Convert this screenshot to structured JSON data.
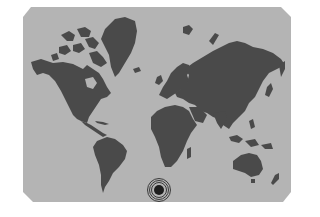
{
  "map": {
    "projection": "world-map",
    "ocean_color": "#b4b4b4",
    "land_color": "#4a4a4a",
    "background_color": "#ffffff",
    "regions": [
      "North America",
      "Greenland",
      "South America",
      "Europe",
      "Africa",
      "Asia",
      "Australia",
      "New Zealand",
      "Arctic Islands"
    ]
  },
  "marker": {
    "icon": "target-icon",
    "ring_color": "#3a3a3a",
    "center_color": "#1e1e1e"
  }
}
